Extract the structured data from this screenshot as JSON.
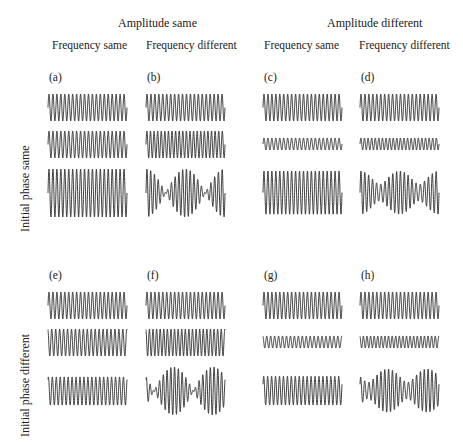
{
  "figure": {
    "column_groups": [
      {
        "label": "Amplitude same",
        "x": 118
      },
      {
        "label": "Amplitude different",
        "x": 327
      }
    ],
    "column_headers": [
      {
        "label": "Frequency same",
        "x": 52
      },
      {
        "label": "Frequency different",
        "x": 146
      },
      {
        "label": "Frequency same",
        "x": 264
      },
      {
        "label": "Frequency different",
        "x": 359
      }
    ],
    "row_labels": [
      {
        "label": "Initial phase same",
        "x": 18,
        "y": 232
      },
      {
        "label": "Initial phase different",
        "x": 18,
        "y": 437
      }
    ],
    "panels": [
      {
        "id": "a",
        "label": "(a)",
        "amplitude": "same",
        "frequency": "same",
        "phase": "same",
        "col": 0,
        "row": 0
      },
      {
        "id": "b",
        "label": "(b)",
        "amplitude": "same",
        "frequency": "different",
        "phase": "same",
        "col": 1,
        "row": 0
      },
      {
        "id": "c",
        "label": "(c)",
        "amplitude": "different",
        "frequency": "same",
        "phase": "same",
        "col": 2,
        "row": 0
      },
      {
        "id": "d",
        "label": "(d)",
        "amplitude": "different",
        "frequency": "different",
        "phase": "same",
        "col": 3,
        "row": 0
      },
      {
        "id": "e",
        "label": "(e)",
        "amplitude": "same",
        "frequency": "same",
        "phase": "different",
        "col": 0,
        "row": 1
      },
      {
        "id": "f",
        "label": "(f)",
        "amplitude": "same",
        "frequency": "different",
        "phase": "different",
        "col": 1,
        "row": 1
      },
      {
        "id": "g",
        "label": "(g)",
        "amplitude": "different",
        "frequency": "same",
        "phase": "different",
        "col": 2,
        "row": 1
      },
      {
        "id": "h",
        "label": "(h)",
        "amplitude": "different",
        "frequency": "different",
        "phase": "different",
        "col": 3,
        "row": 1
      }
    ],
    "layout": {
      "col_x": [
        48,
        146,
        263,
        360
      ],
      "col_w": 79,
      "row_y": [
        0,
        198
      ],
      "label_y": 72,
      "wave1_center": 107,
      "wave2_center": 144,
      "wave3_center": 193,
      "base_half_amp": 13.5,
      "small_half_amp": 6,
      "sum_half_amp": 24,
      "cycles": 20,
      "cycles_diff": 22,
      "colors": {
        "stroke": "#2a2a2a",
        "text": "#222222",
        "background": "#ffffff"
      }
    }
  }
}
